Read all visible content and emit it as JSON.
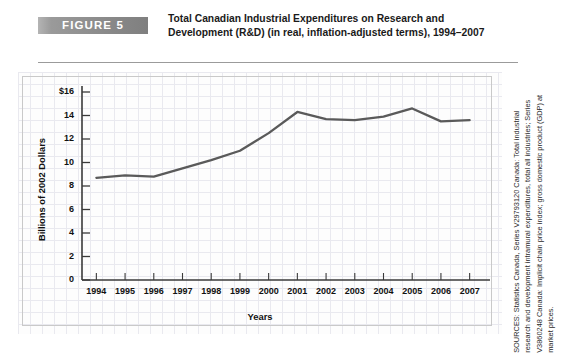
{
  "figure": {
    "badge_label": "FIGURE 5",
    "title": "Total Canadian Industrial Expenditures on Research and Development (R&D) (in real, inflation-adjusted terms), 1994–2007"
  },
  "sources": {
    "text": "SOURCES: Statistics Canada, Series V29793120 Canada: Total industrial research and development intramural expenditures, total all industries; Series V3860248 Canada: Implicit chain price index; gross domestic product (GDP) at market prices."
  },
  "colors": {
    "line": "#5a5a5a",
    "badge": "#8c8c8c",
    "grid": "#e9e9ef",
    "frame": "#c9c9c9",
    "axis": "#3a3a3a",
    "text": "#111111"
  },
  "chart_data": {
    "type": "line",
    "title": "Total Canadian Industrial Expenditures on Research and Development (R&D) (in real, inflation-adjusted terms), 1994–2007",
    "xlabel": "Years",
    "ylabel": "Billions of 2002 Dollars",
    "categories": [
      "1994",
      "1995",
      "1996",
      "1997",
      "1998",
      "1999",
      "2000",
      "2001",
      "2002",
      "2003",
      "2004",
      "2005",
      "2006",
      "2007"
    ],
    "values": [
      8.7,
      8.9,
      8.8,
      9.5,
      10.2,
      11.0,
      12.5,
      14.3,
      13.7,
      13.6,
      13.9,
      14.6,
      13.5,
      13.6
    ],
    "series": [
      {
        "name": "Industrial R&D expenditures (billions of 2002 dollars)",
        "values": [
          8.7,
          8.9,
          8.8,
          9.5,
          10.2,
          11.0,
          12.5,
          14.3,
          13.7,
          13.6,
          13.9,
          14.6,
          13.5,
          13.6
        ]
      }
    ],
    "ylim": [
      0,
      16
    ],
    "ytick_values": [
      0,
      2,
      4,
      6,
      8,
      10,
      12,
      14,
      16
    ],
    "ytick_labels": [
      "0",
      "2",
      "4",
      "6",
      "8",
      "10",
      "12",
      "14",
      "$16"
    ],
    "xtick_labels": [
      "1994",
      "1995",
      "1996",
      "1997",
      "1998",
      "1999",
      "2000",
      "2001",
      "2002",
      "2003",
      "2004",
      "2005",
      "2006",
      "2007"
    ],
    "grid": true,
    "legend": false,
    "legend_position": "none"
  }
}
